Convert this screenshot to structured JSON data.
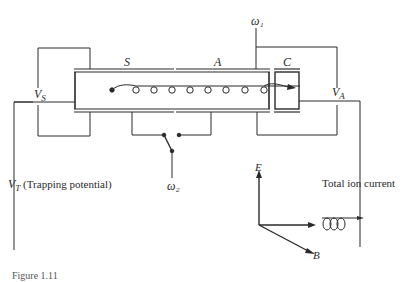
{
  "figure": {
    "caption": "Figure 1.11",
    "labels": {
      "s": "S",
      "a": "A",
      "c": "C",
      "vs": "V",
      "vs_sub": "S",
      "va": "V",
      "va_sub": "A",
      "vt": "V",
      "vt_sub": "T",
      "trapping": "(Trapping potential)",
      "omega1": "ω₁",
      "omega2": "ω₂",
      "total_ion_current": "Total ion current",
      "e_axis": "E",
      "b_axis": "B"
    },
    "colors": {
      "line": "#2a2a2a",
      "background": "#ffffff"
    }
  }
}
